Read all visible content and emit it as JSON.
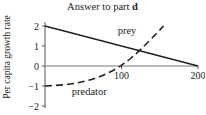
{
  "chart_data": {
    "type": "line",
    "title": "Answer to part d",
    "title_prefix": "Answer to part",
    "title_bold": "d",
    "xlabel": "",
    "ylabel": "Per capita growth rate",
    "xlim": [
      0,
      200
    ],
    "ylim": [
      -2,
      2
    ],
    "x_ticks": [
      100,
      200
    ],
    "x_tick_labels": [
      "100",
      "200"
    ],
    "y_ticks": [
      2,
      1,
      0,
      -1,
      -2
    ],
    "y_tick_labels": [
      "2",
      "1",
      "0",
      "−1",
      "−2"
    ],
    "grid": false,
    "series": [
      {
        "name": "prey",
        "style": "solid",
        "x": [
          0,
          200
        ],
        "y": [
          2,
          0
        ]
      },
      {
        "name": "predator",
        "style": "dashed",
        "x": [
          0,
          25,
          50,
          75,
          100,
          125,
          155
        ],
        "y": [
          -1,
          -0.95,
          -0.8,
          -0.5,
          0,
          0.8,
          2
        ]
      }
    ],
    "annotations": [
      {
        "text": "prey",
        "x": 95,
        "y": 1.6
      },
      {
        "text": "predator",
        "x": 35,
        "y": -1.45
      }
    ]
  }
}
